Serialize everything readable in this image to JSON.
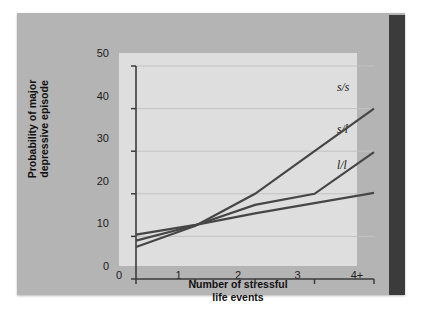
{
  "figure": {
    "background_color": "#b4b4b4",
    "panel_color": "#dedede",
    "spine_color": "#3b3b3b",
    "line_color": "#464646"
  },
  "chart_data": {
    "type": "line",
    "title": "",
    "xlabel_line1": "Number of stressful",
    "xlabel_line2": "life events",
    "ylabel_line1": "Probability of major",
    "ylabel_line2": "depressive episode",
    "categories": [
      "0",
      "1",
      "2",
      "3",
      "4+"
    ],
    "x": [
      0,
      1,
      2,
      3,
      4
    ],
    "xtick_labels": [
      "0",
      "1",
      "2",
      "3",
      "4+"
    ],
    "ytick_labels": [
      "0",
      "10",
      "20",
      "30",
      "40",
      "50"
    ],
    "yticks": [
      0,
      10,
      20,
      30,
      40,
      50
    ],
    "ylim": [
      0,
      50
    ],
    "xlim": [
      0,
      4
    ],
    "grid": "horizontal",
    "legend_position": "inline-right-of-line-ends",
    "series": [
      {
        "name": "s/s",
        "label": "s/s",
        "values": [
          7.5,
          12.5,
          20.0,
          30.0,
          40.0
        ]
      },
      {
        "name": "s/l",
        "label": "s/l",
        "values": [
          9.0,
          12.6,
          17.4,
          20.0,
          29.8
        ]
      },
      {
        "name": "l/l",
        "label": "l/l",
        "values": [
          10.4,
          12.7,
          15.4,
          17.8,
          20.2
        ]
      }
    ]
  }
}
